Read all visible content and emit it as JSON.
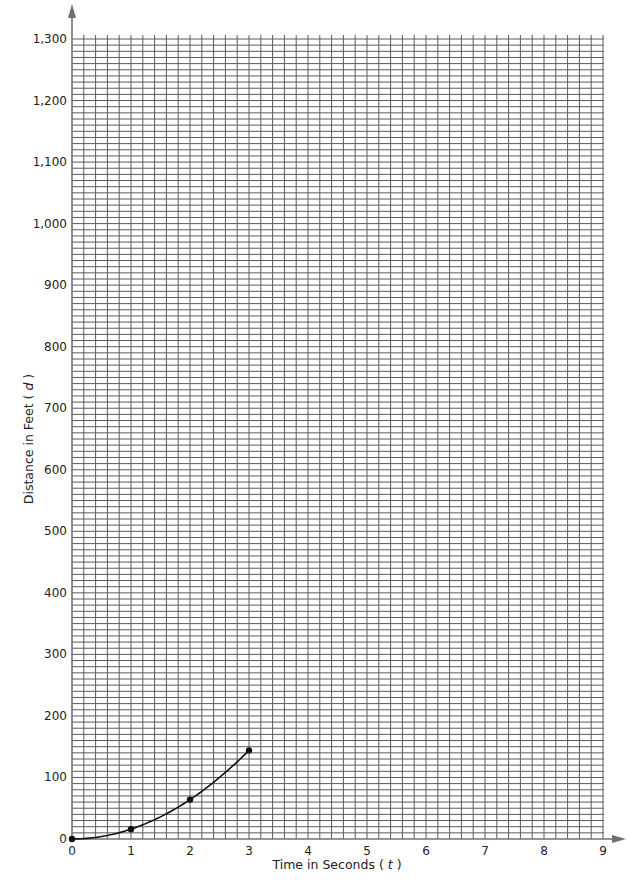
{
  "chart_data": {
    "type": "line",
    "title": "",
    "xlabel": "Time in Seconds (t)",
    "ylabel": "Distance in Feet (d)",
    "xlabel_parts": {
      "text": "Time in Seconds (",
      "var": "t",
      "close": " )"
    },
    "ylabel_parts": {
      "text": "Distance in Feet (",
      "var": "d",
      "close": " )"
    },
    "xlim": [
      0,
      9
    ],
    "ylim": [
      0,
      1300
    ],
    "x_ticks": [
      "0",
      "1",
      "2",
      "3",
      "4",
      "5",
      "6",
      "7",
      "8",
      "9"
    ],
    "y_ticks": [
      "0",
      "100",
      "200",
      "300",
      "400",
      "500",
      "600",
      "700",
      "800",
      "900",
      "1,000",
      "1,100",
      "1,200",
      "1,300"
    ],
    "grid": true,
    "grid_minor_x_per_unit": 5,
    "grid_minor_y_per_100": 10,
    "series": [
      {
        "name": "d = 16t²",
        "x": [
          0,
          1,
          2,
          3
        ],
        "y": [
          0,
          16,
          64,
          144
        ],
        "markers": true,
        "smooth": true
      }
    ],
    "colors": {
      "grid": "#5a5a5a",
      "axis": "#707070",
      "line": "#111111"
    }
  }
}
